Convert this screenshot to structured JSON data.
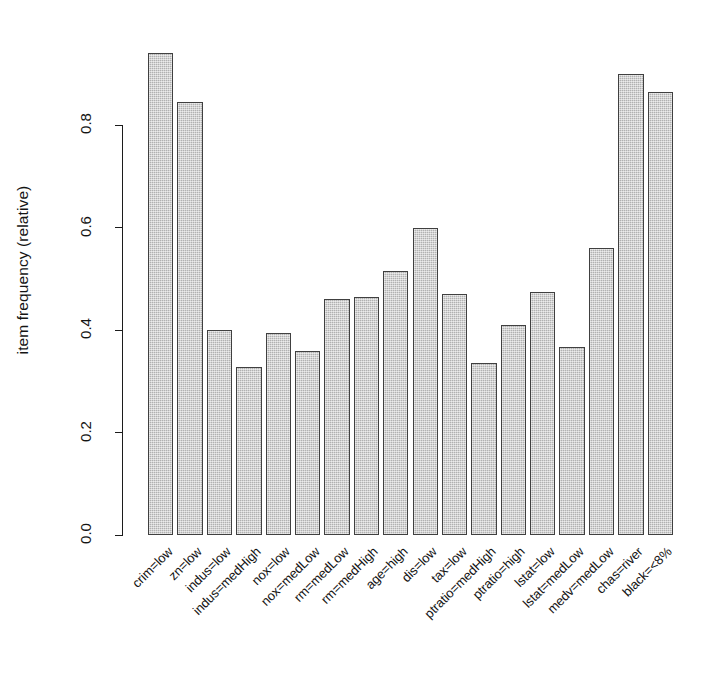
{
  "chart_data": {
    "type": "bar",
    "title": "",
    "subtitle": "",
    "xlabel": "",
    "ylabel": "item frequency (relative)",
    "ylim": [
      0.0,
      0.95
    ],
    "yticks": [
      "0.0",
      "0.2",
      "0.4",
      "0.6",
      "0.8"
    ],
    "ytick_values": [
      0.0,
      0.2,
      0.4,
      0.6,
      0.8
    ],
    "grid": false,
    "legend": null,
    "bar_color": "#c3c3c3",
    "bar_border_color": "#404040",
    "axis_color": "#1c1c1c",
    "categories": [
      "crim=low",
      "zn=low",
      "indus=low",
      "indus=medHigh",
      "nox=low",
      "nox=medLow",
      "rm=medLow",
      "rm=medHigh",
      "age=high",
      "dis=low",
      "tax=low",
      "ptratio=medHigh",
      "ptratio=high",
      "lstat=low",
      "lstat=medLow",
      "medv=medLow",
      "chas=river",
      "black=<8%"
    ],
    "values": [
      0.94,
      0.845,
      0.4,
      0.327,
      0.395,
      0.36,
      0.46,
      0.465,
      0.515,
      0.6,
      0.47,
      0.335,
      0.41,
      0.475,
      0.366,
      0.56,
      0.9,
      0.865
    ]
  },
  "axis": {
    "y_title": "item frequency (relative)"
  }
}
